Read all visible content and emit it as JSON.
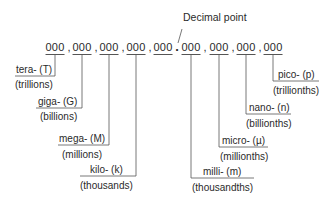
{
  "title": "Decimal point",
  "digit_group": "000",
  "separator": ",",
  "decimal_symbol": ".",
  "left_groups": [
    {
      "x": 55,
      "prefix": "tera- (T)",
      "meaning": "(trillions)",
      "line_bottom": 76,
      "label_left": 15
    },
    {
      "x": 82,
      "prefix": "giga- (G)",
      "meaning": "(billions)",
      "line_bottom": 108,
      "label_left": 36
    },
    {
      "x": 109,
      "prefix": "mega- (M)",
      "meaning": "(millions)",
      "line_bottom": 145,
      "label_left": 58
    },
    {
      "x": 136,
      "prefix": "kilo- (k)",
      "meaning": "(thousands)",
      "line_bottom": 176,
      "label_left": 80
    },
    {
      "x": 163
    }
  ],
  "right_groups": [
    {
      "x": 191,
      "prefix": "milli- (m)",
      "meaning": "(thousandths)",
      "line_bottom": 178,
      "label_right": 254
    },
    {
      "x": 219,
      "prefix": "micro- (µ)",
      "meaning": "(millionths)",
      "line_bottom": 147,
      "label_right": 268
    },
    {
      "x": 246,
      "prefix": "nano- (n)",
      "meaning": "(billionths)",
      "line_bottom": 114,
      "label_right": 291
    },
    {
      "x": 273,
      "prefix": "pico- (p)",
      "meaning": "(trillionths)",
      "line_bottom": 81,
      "label_right": 319
    }
  ],
  "colors": {
    "line": "#555555",
    "text": "#2a2a2a"
  }
}
